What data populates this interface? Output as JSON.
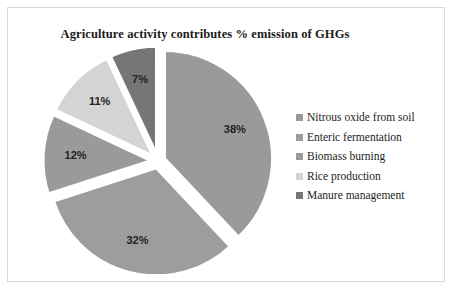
{
  "chart_data": {
    "type": "pie",
    "title": "Agriculture activity contributes % emission of GHGs",
    "xlabel": "",
    "ylabel": "",
    "grid": false,
    "legend_position": "right",
    "exploded": true,
    "start_angle_deg": 0,
    "direction": "clockwise",
    "categories": [
      "Nitrous oxide from soil",
      "Enteric fermentation",
      "Biomass burning",
      "Rice production",
      "Manure management"
    ],
    "values": [
      38,
      32,
      12,
      11,
      7
    ],
    "value_unit": "%",
    "data_labels": [
      "38%",
      "32%",
      "12%",
      "11%",
      "7%"
    ],
    "slice_colors": [
      "#9a9a9a",
      "#9d9d9d",
      "#9a9a9a",
      "#d4d4d4",
      "#767676"
    ]
  },
  "legend": {
    "items": [
      {
        "label": "Nitrous oxide from soil",
        "color": "#9a9a9a"
      },
      {
        "label": "Enteric fermentation",
        "color": "#9d9d9d"
      },
      {
        "label": "Biomass burning",
        "color": "#9a9a9a"
      },
      {
        "label": "Rice production",
        "color": "#d4d4d4"
      },
      {
        "label": "Manure management",
        "color": "#767676"
      }
    ]
  },
  "frame": {
    "border_color": "#d9d9d9",
    "background": "#ffffff"
  }
}
